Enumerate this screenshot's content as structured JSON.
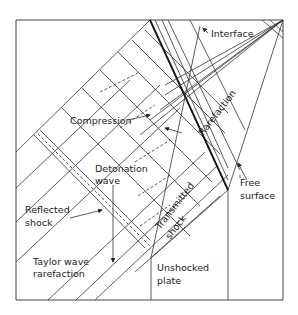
{
  "diagram": {
    "type": "wave-interaction x-t diagram",
    "labels": {
      "interface": "Interface",
      "compression": "Compression",
      "rarefaction": "Rarefaction",
      "detonation_wave_1": "Detonation",
      "detonation_wave_2": "wave",
      "reflected_shock_1": "Reflected",
      "reflected_shock_2": "shock",
      "free_surface_1": "Free",
      "free_surface_2": "surface",
      "transmitted_shock_1": "Transmitted",
      "transmitted_shock_2": "shock",
      "taylor_wave_1": "Taylor wave",
      "taylor_wave_2": "rarefaction",
      "unshocked_plate_1": "Unshocked",
      "unshocked_plate_2": "plate"
    },
    "colors": {
      "line": "#333333",
      "background": "#ffffff"
    }
  }
}
